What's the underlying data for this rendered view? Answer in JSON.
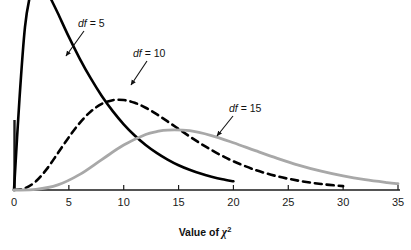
{
  "chart_data": {
    "type": "line",
    "title": "",
    "xlabel": "Value of χ²",
    "ylabel": "",
    "xlim": [
      0,
      35
    ],
    "ylim": [
      0,
      0.16
    ],
    "grid": false,
    "legend_position": "inline-annotations",
    "xticks": [
      "0",
      "5",
      "10",
      "15",
      "20",
      "25",
      "30",
      "35"
    ],
    "xtick_values": [
      0,
      5,
      10,
      15,
      20,
      25,
      30,
      35
    ],
    "yticks": [],
    "series": [
      {
        "name": "df = 5",
        "df": 5,
        "style": "solid",
        "color": "#000000",
        "linewidth": 2.6,
        "mode": 3,
        "label": "df = 5",
        "label_df": "df",
        "label_rest": " = 5",
        "x": [
          0,
          0.5,
          1,
          1.5,
          2,
          2.5,
          3,
          3.5,
          4,
          5,
          6,
          7,
          8,
          9,
          10,
          11,
          12,
          13,
          14,
          15,
          16,
          17,
          18,
          19,
          20
        ],
        "values": [
          0,
          0.0807,
          0.144,
          0.1731,
          0.1839,
          0.1823,
          0.1755,
          0.1662,
          0.1562,
          0.1353,
          0.116,
          0.0986,
          0.0831,
          0.0697,
          0.0581,
          0.0482,
          0.0398,
          0.0328,
          0.0269,
          0.0219,
          0.0179,
          0.0145,
          0.0118,
          0.0095,
          0.0077
        ]
      },
      {
        "name": "df = 10",
        "df": 10,
        "style": "dashed",
        "color": "#000000",
        "linewidth": 2.6,
        "mode": 8,
        "label": "df = 10",
        "label_df": "df",
        "label_rest": " = 10",
        "x": [
          0,
          1,
          2,
          3,
          4,
          5,
          6,
          7,
          8,
          9,
          10,
          11,
          12,
          13,
          14,
          15,
          16,
          17,
          18,
          19,
          20,
          22,
          24,
          26,
          28,
          30
        ],
        "values": [
          0,
          0.0016,
          0.0077,
          0.0187,
          0.0326,
          0.0467,
          0.0594,
          0.0694,
          0.0761,
          0.0794,
          0.0795,
          0.0771,
          0.0727,
          0.067,
          0.0606,
          0.054,
          0.0474,
          0.0411,
          0.0353,
          0.0301,
          0.0254,
          0.0177,
          0.0121,
          0.0081,
          0.0053,
          0.0034
        ]
      },
      {
        "name": "df = 15",
        "df": 15,
        "style": "solid",
        "color": "#a8a8a8",
        "linewidth": 2.8,
        "mode": 13,
        "label": "df = 15",
        "label_df": "df",
        "label_rest": " = 15",
        "x": [
          0,
          2,
          4,
          6,
          8,
          10,
          12,
          13,
          14,
          16,
          18,
          20,
          22,
          24,
          26,
          28,
          30,
          32,
          34,
          35
        ],
        "values": [
          0,
          0.0005,
          0.0045,
          0.0138,
          0.0269,
          0.0397,
          0.049,
          0.0516,
          0.053,
          0.0524,
          0.0481,
          0.0418,
          0.0348,
          0.028,
          0.0218,
          0.0166,
          0.0124,
          0.0091,
          0.0066,
          0.0056
        ]
      }
    ],
    "annotations": [
      {
        "name": "df-5-annotation",
        "text": "df = 5",
        "label_x": 78,
        "label_y": 27,
        "arrow_from_x": 84,
        "arrow_from_y": 31,
        "arrow_to_x": 66,
        "arrow_to_y": 56
      },
      {
        "name": "df-10-annotation",
        "text": "df = 10",
        "label_x": 133,
        "label_y": 57,
        "arrow_from_x": 147,
        "arrow_from_y": 61,
        "arrow_to_x": 131,
        "arrow_to_y": 85
      },
      {
        "name": "df-15-annotation",
        "text": "df = 15",
        "label_x": 229,
        "label_y": 112,
        "arrow_from_x": 233,
        "arrow_from_y": 116,
        "arrow_to_x": 217,
        "arrow_to_y": 136
      }
    ]
  },
  "axis": {
    "x_title_prefix": "Value of ",
    "x_title_symbol": "χ",
    "x_title_exponent": "2",
    "tick_labels": [
      "0",
      "5",
      "10",
      "15",
      "20",
      "25",
      "30",
      "35"
    ]
  },
  "colors": {
    "curve_solid": "#000000",
    "curve_dashed": "#000000",
    "curve_gray": "#a8a8a8",
    "axis": "#1a1a1a",
    "text": "#111111",
    "background": "#ffffff"
  }
}
